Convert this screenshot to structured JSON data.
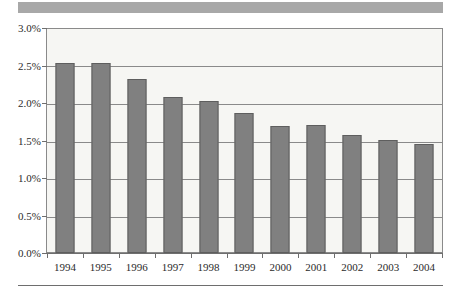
{
  "chart_data": {
    "type": "bar",
    "title": "",
    "subtitle": "",
    "xlabel": "",
    "ylabel": "",
    "categories": [
      "1994",
      "1995",
      "1996",
      "1997",
      "1998",
      "1999",
      "2000",
      "2001",
      "2002",
      "2003",
      "2004"
    ],
    "values": [
      2.55,
      2.54,
      2.33,
      2.09,
      2.03,
      1.87,
      1.7,
      1.71,
      1.58,
      1.52,
      1.46
    ],
    "value_suffix": "%",
    "ylim": [
      0.0,
      3.0
    ],
    "ytick_values": [
      3.0,
      2.5,
      2.0,
      1.5,
      1.0,
      0.5,
      0.0
    ],
    "ytick_labels": [
      "3.0%",
      "2.5%",
      "2.0%",
      "1.5%",
      "1.0%",
      "0.5%",
      "0.0%"
    ],
    "grid": true,
    "grid_axis": "y",
    "legend": false,
    "legend_position": "none",
    "series": [
      {
        "name": "",
        "values": [
          2.55,
          2.54,
          2.33,
          2.09,
          2.03,
          1.87,
          1.7,
          1.71,
          1.58,
          1.52,
          1.46
        ]
      }
    ],
    "colors": {
      "bar_fill": "#808080",
      "bar_border": "#5e5e5e",
      "plot_background": "#f6f6f3",
      "gridline": "#8a8a8a",
      "axis": "#6e6e6e",
      "text": "#2b2b2b",
      "top_band": "#a8a8a8",
      "page_background": "#ffffff"
    }
  },
  "decorations": {
    "top_band_name": "header-band",
    "bottom_rule_name": "footer-rule"
  }
}
